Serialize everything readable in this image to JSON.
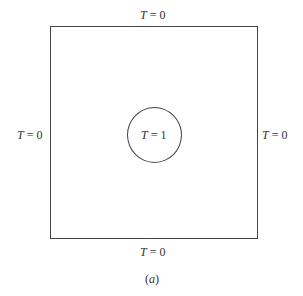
{
  "diagram": {
    "boundaries": {
      "top": {
        "var": "T",
        "eq": " = 0"
      },
      "bottom": {
        "var": "T",
        "eq": " = 0"
      },
      "left": {
        "var": "T",
        "eq": " = 0"
      },
      "right": {
        "var": "T",
        "eq": " = 0"
      }
    },
    "inner_circle": {
      "var": "T",
      "eq": " = 1"
    },
    "caption": {
      "open": "(",
      "letter": "a",
      "close": ")"
    }
  }
}
